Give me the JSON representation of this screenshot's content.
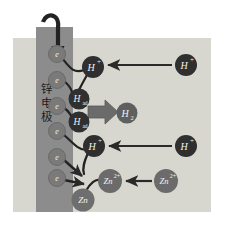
{
  "figure": {
    "colors": {
      "background": "#ffffff",
      "solution": "#d8d7cf",
      "electrode": "#8c8c8c",
      "electron_circle": "#7a7a7a",
      "hplus_circle": "#2f2f2f",
      "had_circle": "#303030",
      "h2_circle": "#5f5f5f",
      "zn2plus_circle": "#6b6b6b",
      "zn_circle": "#6e6e6e",
      "arrow": "#2a2a2a",
      "thick_arrow": "#6b6b6b",
      "label_light": "#f2f2ef",
      "label_dark": "#2b2b2b"
    }
  },
  "electrode": {
    "label": "锌电极",
    "label_chars": [
      "锌",
      "电",
      "极"
    ]
  },
  "species": {
    "electron": "e",
    "proton": "H",
    "proton_charge": "+",
    "adsorbed_hydrogen": "H",
    "adsorbed_subscript": "ad",
    "hydrogen_gas": "H",
    "hydrogen_gas_subscript": "2",
    "zinc_ion": "Zn",
    "zinc_ion_charge": "2+",
    "zinc_atom": "Zn"
  },
  "electrons": [
    {
      "id": "e1",
      "label": "e",
      "cx": 57,
      "cy": 54,
      "r": 8.5
    },
    {
      "id": "e2",
      "label": "e",
      "cx": 57,
      "cy": 80,
      "r": 8.5
    },
    {
      "id": "e3",
      "label": "e",
      "cx": 57,
      "cy": 106,
      "r": 8.5
    },
    {
      "id": "e4",
      "label": "e",
      "cx": 57,
      "cy": 131,
      "r": 8.5
    },
    {
      "id": "e5",
      "label": "e",
      "cx": 57,
      "cy": 157,
      "r": 8.5
    },
    {
      "id": "e6",
      "label": "e",
      "cx": 57,
      "cy": 178,
      "r": 8.5
    }
  ],
  "protons_surface": [
    {
      "id": "hplus-top",
      "label": "H",
      "sup": "+",
      "cx": 93,
      "cy": 67,
      "r": 11
    },
    {
      "id": "hplus-bottom",
      "label": "H",
      "sup": "+",
      "cx": 94,
      "cy": 146,
      "r": 11
    }
  ],
  "protons_bulk": [
    {
      "id": "hplus-bulk-top",
      "label": "H",
      "sup": "+",
      "cx": 186,
      "cy": 65,
      "r": 11
    },
    {
      "id": "hplus-bulk-bottom",
      "label": "H",
      "sup": "+",
      "cx": 186,
      "cy": 146,
      "r": 11
    }
  ],
  "adsorbed": [
    {
      "id": "had-upper",
      "label": "H",
      "sub": "ad",
      "cx": 79,
      "cy": 99,
      "r": 10.5
    },
    {
      "id": "had-lower",
      "label": "H",
      "sub": "ad",
      "cx": 79,
      "cy": 122,
      "r": 10.5
    }
  ],
  "hydrogen_gas": {
    "id": "h2",
    "label": "H",
    "sub": "2",
    "cx": 127,
    "cy": 113,
    "r": 10.5
  },
  "zinc_ions": [
    {
      "id": "zn2-surface",
      "label": "Zn",
      "sup": "2+",
      "cx": 110,
      "cy": 181,
      "r": 12
    },
    {
      "id": "zn2-bulk",
      "label": "Zn",
      "sup": "2+",
      "cx": 166,
      "cy": 181,
      "r": 12
    }
  ],
  "zinc_atom": {
    "id": "zn-atom",
    "label": "Zn",
    "cx": 83,
    "cy": 200,
    "r": 11.5
  },
  "arrows": {
    "current_in": {
      "name": "electron-supply-arrow",
      "description": "curved arrow entering top of electrode"
    },
    "proton_migration_top": {
      "name": "proton-migration-arrow-top"
    },
    "proton_migration_bottom": {
      "name": "proton-migration-arrow-bottom"
    },
    "zinc_ion_migration": {
      "name": "zinc-ion-migration-arrow"
    },
    "hydrogen_release": {
      "name": "hydrogen-evolution-arrow"
    }
  },
  "geometry": {
    "solution": {
      "x": 13,
      "y": 38,
      "w": 198,
      "h": 174
    },
    "electrode": {
      "x": 36,
      "y": 27,
      "w": 37,
      "h": 185
    }
  }
}
